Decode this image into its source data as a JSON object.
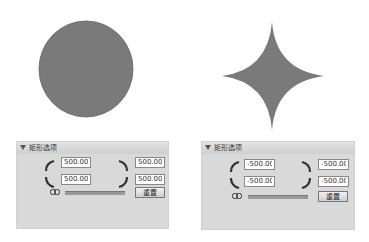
{
  "shapes": {
    "left": {
      "type": "circle",
      "fill": "#7a7a7a"
    },
    "right": {
      "type": "concave-star",
      "fill": "#7a7a7a"
    }
  },
  "panels": [
    {
      "header": "矩形选项",
      "fields": {
        "top_left": "500.00",
        "bottom_left": "500.00",
        "top_right": "500.00",
        "bottom_right": "500.00"
      },
      "reset_label": "重置"
    },
    {
      "header": "矩形选项",
      "fields": {
        "top_left": "-500.00",
        "bottom_left": "-500.00",
        "top_right": "-500.00",
        "bottom_right": "-500.00"
      },
      "reset_label": "重置"
    }
  ],
  "colors": {
    "panel_bg": "#d9d9d9",
    "shape_fill": "#7a7a7a"
  }
}
